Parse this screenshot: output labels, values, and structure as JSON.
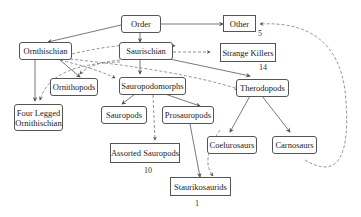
{
  "diagram": {
    "type": "taxonomy graph",
    "nodes": [
      {
        "id": "order",
        "label": "Order"
      },
      {
        "id": "other",
        "label": "Other",
        "count": "5"
      },
      {
        "id": "ornithischian",
        "label": "Ornthischian"
      },
      {
        "id": "saurischian",
        "label": "Saurischian"
      },
      {
        "id": "strange_killers",
        "label": "Strange Killers",
        "count": "14"
      },
      {
        "id": "ornithopods",
        "label": "Ornithopods"
      },
      {
        "id": "sauropodomorphs",
        "label": "Sauropodomorphs"
      },
      {
        "id": "therodopods",
        "label": "Therodopods"
      },
      {
        "id": "four_legged",
        "label": "Four Legged Ornithischian",
        "line1": "Four Legged",
        "line2": "Ornithischian"
      },
      {
        "id": "sauropods",
        "label": "Sauropods"
      },
      {
        "id": "prosauropods",
        "label": "Prosauropods"
      },
      {
        "id": "coelurosaurs",
        "label": "Coelurosaurs"
      },
      {
        "id": "carnosaurs",
        "label": "Carnosaurs"
      },
      {
        "id": "assorted_sauropods",
        "label": "Assorted Sauropods",
        "count": "10"
      },
      {
        "id": "staurikosaurids",
        "label": "Staurikosaurids",
        "count": "1"
      }
    ],
    "edges_solid": [
      [
        "order",
        "ornithischian"
      ],
      [
        "order",
        "saurischian"
      ],
      [
        "order",
        "other"
      ],
      [
        "ornithischian",
        "four_legged"
      ],
      [
        "ornithischian",
        "ornithopods"
      ],
      [
        "saurischian",
        "sauropodomorphs"
      ],
      [
        "saurischian",
        "therodopods"
      ],
      [
        "sauropodomorphs",
        "sauropods"
      ],
      [
        "sauropodomorphs",
        "prosauropods"
      ],
      [
        "prosauropods",
        "staurikosaurids"
      ],
      [
        "therodopods",
        "coelurosaurs"
      ],
      [
        "therodopods",
        "carnosaurs"
      ]
    ],
    "edges_dashed": [
      [
        "saurischian",
        "strange_killers"
      ],
      [
        "ornithischian",
        "sauropodomorphs"
      ],
      [
        "ornithischian",
        "therodopods"
      ],
      [
        "sauropodomorphs",
        "assorted_sauropods"
      ],
      [
        "carnosaurs",
        "other"
      ],
      [
        "coelurosaurs",
        "staurikosaurids"
      ],
      [
        "saurischian",
        "ornithopods"
      ],
      [
        "saurischian",
        "four_legged"
      ]
    ]
  }
}
